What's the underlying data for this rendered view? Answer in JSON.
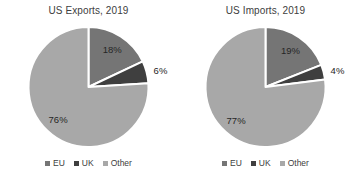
{
  "background_color": "#ffffff",
  "title_color": "#404040",
  "label_color": "#262626",
  "chart_data": [
    {
      "type": "pie",
      "title": "US Exports, 2019",
      "categories": [
        "EU",
        "UK",
        "Other"
      ],
      "values": [
        18,
        6,
        76
      ],
      "data_labels": [
        "18%",
        "6%",
        "76%"
      ],
      "colors": [
        "#757575",
        "#3f3f3f",
        "#a8a8a8"
      ],
      "legend_position": "bottom",
      "start_angle_deg": 0,
      "direction": "clockwise"
    },
    {
      "type": "pie",
      "title": "US Imports, 2019",
      "categories": [
        "EU",
        "UK",
        "Other"
      ],
      "values": [
        19,
        4,
        77
      ],
      "data_labels": [
        "19%",
        "4%",
        "77%"
      ],
      "colors": [
        "#757575",
        "#3f3f3f",
        "#a8a8a8"
      ],
      "legend_position": "bottom",
      "start_angle_deg": 0,
      "direction": "clockwise"
    }
  ]
}
